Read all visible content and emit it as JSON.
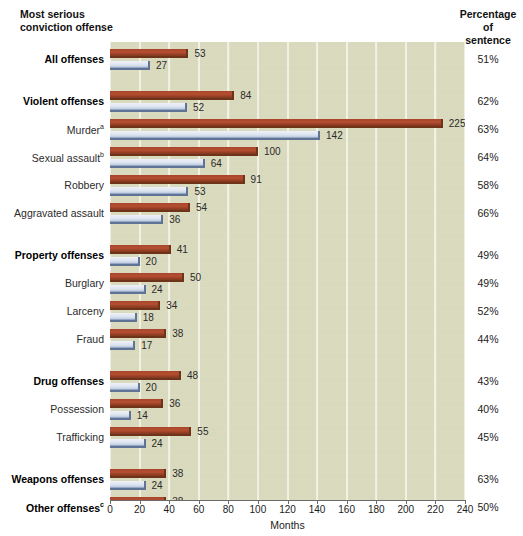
{
  "top_caption": "",
  "headers": {
    "left_line1": "Most serious",
    "left_line2": "conviction offense",
    "right_line1": "Percentage",
    "right_line2": "of",
    "right_line3": "sentence"
  },
  "axis": {
    "xlabel": "Months",
    "ticks": [
      "0",
      "20",
      "40",
      "60",
      "80",
      "100",
      "120",
      "140",
      "160",
      "180",
      "200",
      "220",
      "240"
    ]
  },
  "chart_data": {
    "type": "bar",
    "orientation": "horizontal",
    "title": "",
    "xlabel": "Months",
    "ylabel": "Most serious conviction offense",
    "xlim": [
      0,
      240
    ],
    "xticks": [
      0,
      20,
      40,
      60,
      80,
      100,
      120,
      140,
      160,
      180,
      200,
      220,
      240
    ],
    "grid": true,
    "legend_position": "none",
    "series": [
      {
        "name": "Mean sentence length",
        "color": "#a8452b",
        "values": [
          53,
          84,
          225,
          100,
          91,
          54,
          41,
          50,
          34,
          38,
          48,
          36,
          55,
          38,
          38
        ]
      },
      {
        "name": "Mean time served",
        "color": "#dde3ef",
        "values": [
          27,
          52,
          142,
          64,
          53,
          36,
          20,
          24,
          18,
          17,
          20,
          14,
          24,
          24,
          19
        ]
      }
    ],
    "categories": [
      "All offenses",
      "Violent offenses",
      "Murder",
      "Sexual assault",
      "Robbery",
      "Aggravated assault",
      "Property offenses",
      "Burglary",
      "Larceny",
      "Fraud",
      "Drug offenses",
      "Possession",
      "Trafficking",
      "Weapons offenses",
      "Other offenses"
    ],
    "annotations": {
      "percentage_of_sentence": [
        "51%",
        "62%",
        "63%",
        "64%",
        "58%",
        "66%",
        "49%",
        "49%",
        "52%",
        "44%",
        "43%",
        "40%",
        "45%",
        "63%",
        "50%"
      ]
    }
  },
  "rows": [
    {
      "label": "All offenses",
      "sup": "",
      "bold": true,
      "red": 53,
      "blue": 27,
      "pct": "51%",
      "y": 6,
      "gap_before": 0
    },
    {
      "label": "Violent offenses",
      "sup": "",
      "bold": true,
      "red": 84,
      "blue": 52,
      "pct": "62%",
      "y": 48,
      "gap_before": 1
    },
    {
      "label": "Murder",
      "sup": "a",
      "bold": false,
      "red": 225,
      "blue": 142,
      "pct": "63%",
      "y": 76,
      "gap_before": 0
    },
    {
      "label": "Sexual assault",
      "sup": "b",
      "bold": false,
      "red": 100,
      "blue": 64,
      "pct": "64%",
      "y": 104,
      "gap_before": 0
    },
    {
      "label": "Robbery",
      "sup": "",
      "bold": false,
      "red": 91,
      "blue": 53,
      "pct": "58%",
      "y": 132,
      "gap_before": 0
    },
    {
      "label": "Aggravated assault",
      "sup": "",
      "bold": false,
      "red": 54,
      "blue": 36,
      "pct": "66%",
      "y": 160,
      "gap_before": 0
    },
    {
      "label": "Property offenses",
      "sup": "",
      "bold": true,
      "red": 41,
      "blue": 20,
      "pct": "49%",
      "y": 202,
      "gap_before": 1
    },
    {
      "label": "Burglary",
      "sup": "",
      "bold": false,
      "red": 50,
      "blue": 24,
      "pct": "49%",
      "y": 230,
      "gap_before": 0
    },
    {
      "label": "Larceny",
      "sup": "",
      "bold": false,
      "red": 34,
      "blue": 18,
      "pct": "52%",
      "y": 258,
      "gap_before": 0
    },
    {
      "label": "Fraud",
      "sup": "",
      "bold": false,
      "red": 38,
      "blue": 17,
      "pct": "44%",
      "y": 286,
      "gap_before": 0
    },
    {
      "label": "Drug offenses",
      "sup": "",
      "bold": true,
      "red": 48,
      "blue": 20,
      "pct": "43%",
      "y": 328,
      "gap_before": 1
    },
    {
      "label": "Possession",
      "sup": "",
      "bold": false,
      "red": 36,
      "blue": 14,
      "pct": "40%",
      "y": 356,
      "gap_before": 0
    },
    {
      "label": "Trafficking",
      "sup": "",
      "bold": false,
      "red": 55,
      "blue": 24,
      "pct": "45%",
      "y": 384,
      "gap_before": 0
    },
    {
      "label": "Weapons offenses",
      "sup": "",
      "bold": true,
      "red": 38,
      "blue": 24,
      "pct": "63%",
      "y": 426,
      "gap_before": 1
    },
    {
      "label": "Other offenses",
      "sup": "c",
      "bold": true,
      "red": 38,
      "blue": 19,
      "pct": "50%",
      "y": 454,
      "gap_before": 0
    }
  ]
}
